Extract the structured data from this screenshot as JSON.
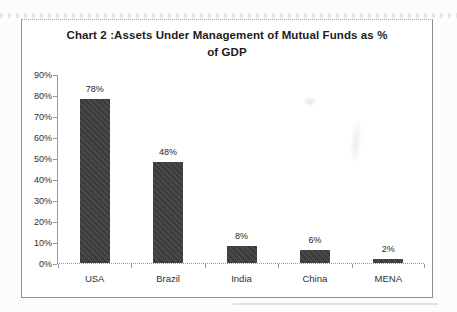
{
  "page": {
    "background_color": "#fcfcfc"
  },
  "chart_data": {
    "type": "bar",
    "title": "Chart 2 :Assets Under Management of Mutual Funds as % of GDP",
    "title_lines": [
      "Chart 2 :Assets Under Management of Mutual Funds as %",
      "of GDP"
    ],
    "categories": [
      "USA",
      "Brazil",
      "India",
      "China",
      "MENA"
    ],
    "values": [
      78,
      48,
      8,
      6,
      2
    ],
    "data_labels": [
      "78%",
      "48%",
      "8%",
      "6%",
      "2%"
    ],
    "yticks": [
      "90%",
      "80%",
      "70%",
      "60%",
      "50%",
      "40%",
      "30%",
      "20%",
      "10%",
      "0%"
    ],
    "ylim": [
      0,
      90
    ],
    "ytick_step": 10,
    "xlabel": "",
    "ylabel": "",
    "grid": false,
    "legend": "none",
    "bar_color": "#3f3f3f",
    "axis_color": "#9a9a9a",
    "label_color": "#262626",
    "title_color": "#1c1c1c"
  }
}
